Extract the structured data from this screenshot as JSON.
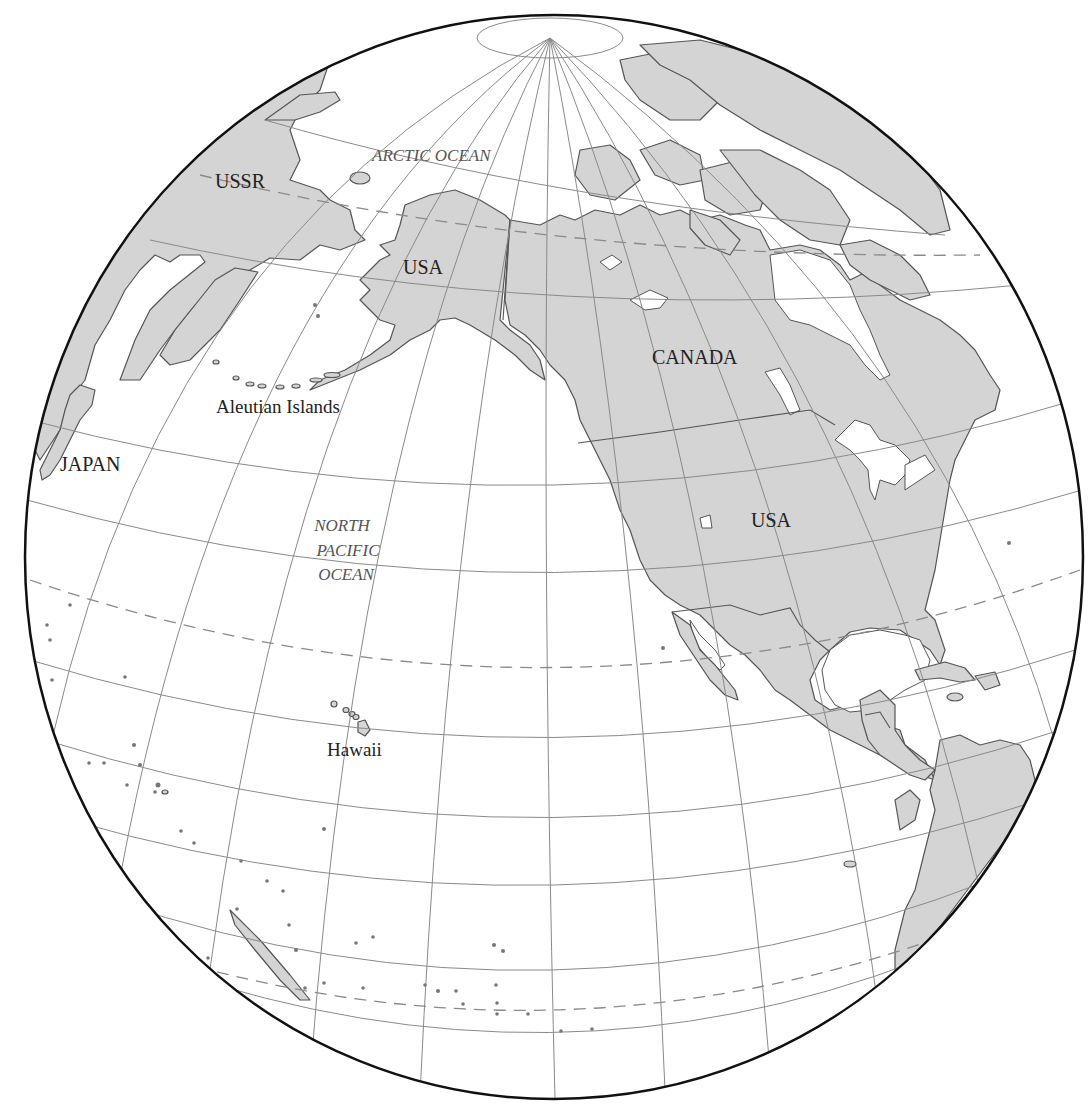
{
  "map": {
    "projection": "orthographic",
    "colors": {
      "land": "#d4d4d4",
      "ocean": "#ffffff",
      "coastline": "#555555",
      "graticule": "#8a8a8a",
      "globe_outline": "#111111",
      "ocean_label": "#555555",
      "country_label": "#222222"
    },
    "labels": {
      "countries": [
        {
          "name": "USSR"
        },
        {
          "name": "USA"
        },
        {
          "name": "CANADA"
        },
        {
          "name": "USA"
        },
        {
          "name": "JAPAN"
        }
      ],
      "regions": [
        {
          "name": "Aleutian Islands"
        },
        {
          "name": "Hawaii"
        }
      ],
      "oceans": [
        {
          "name": "ARCTIC OCEAN"
        },
        {
          "lines": [
            "NORTH",
            "PACIFIC",
            "OCEAN"
          ]
        }
      ]
    }
  }
}
